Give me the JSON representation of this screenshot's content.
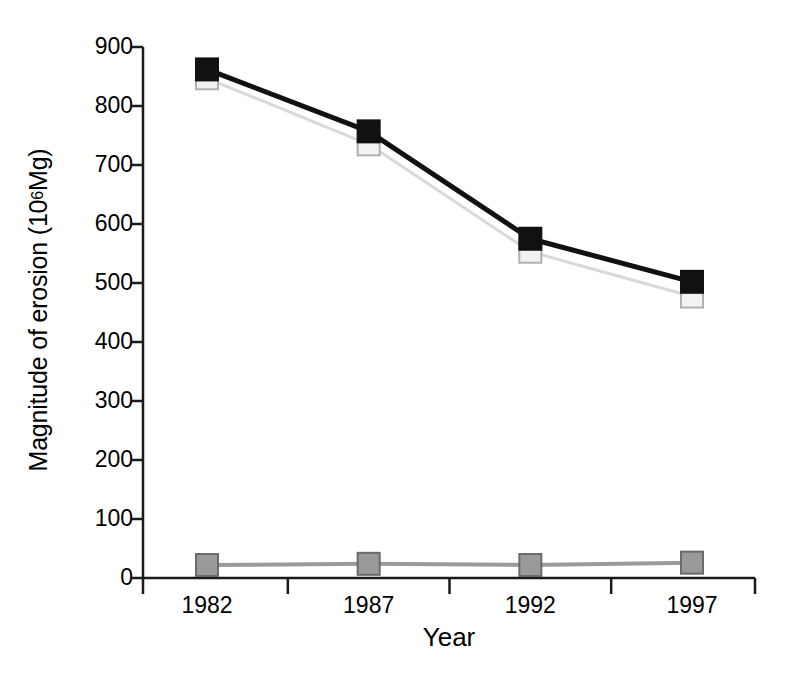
{
  "chart_data": {
    "type": "line",
    "title": "",
    "subtitle": "",
    "xlabel": "Year",
    "ylabel": "Magnitude of erosion (10^6 Mg)",
    "ylabel_base": "Magnitude of erosion (10",
    "ylabel_exp": "6",
    "ylabel_tail": " Mg)",
    "categories": [
      "1982",
      "1987",
      "1992",
      "1997"
    ],
    "x": [
      1982,
      1987,
      1992,
      1997
    ],
    "ylim": [
      0,
      900
    ],
    "xlim_categories": true,
    "yticks": [
      0,
      100,
      200,
      300,
      400,
      500,
      600,
      700,
      800,
      900
    ],
    "ytick_labels": [
      "0",
      "100",
      "200",
      "300",
      "400",
      "500",
      "600",
      "700",
      "800",
      "900"
    ],
    "grid": false,
    "legend": "none",
    "series": [
      {
        "name": "total-erosion-black",
        "marker": "filled-square",
        "line_color": "#111111",
        "marker_color": "#111111",
        "marker_edge_color": "#111111",
        "line_width": 5,
        "values": [
          862,
          757,
          575,
          502
        ]
      },
      {
        "name": "sheet-and-rill-erosion-light",
        "marker": "open-square",
        "line_color": "#d9d9d9",
        "marker_color": "#f2f2f2",
        "marker_edge_color": "#b0b0b0",
        "line_width": 3,
        "values": [
          847,
          735,
          553,
          477
        ]
      },
      {
        "name": "wind-erosion-gray",
        "marker": "filled-square",
        "line_color": "#9a9a9a",
        "marker_color": "#9a9a9a",
        "marker_edge_color": "#6b6b6b",
        "line_width": 4,
        "values": [
          22,
          24,
          22,
          26
        ]
      }
    ],
    "colors": {
      "axis": "#1a1a1a",
      "series_black": "#111111",
      "series_light": "#d9d9d9",
      "series_gray": "#9a9a9a",
      "background": "#ffffff"
    }
  }
}
